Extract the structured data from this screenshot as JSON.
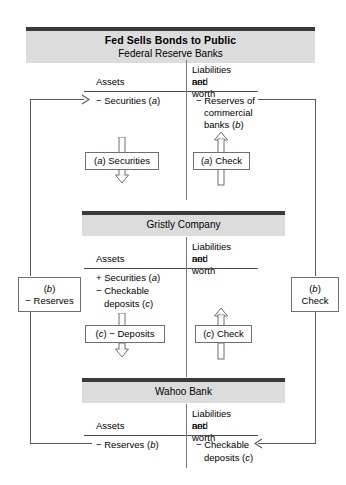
{
  "figure": {
    "title": "Fed Sells Bonds to Public",
    "subtitle": "Federal Reserve Banks"
  },
  "accounts": [
    {
      "name": "fed",
      "header_title": "Fed Sells Bonds to Public",
      "header_subtitle": "Federal Reserve Banks",
      "col_assets": "Assets",
      "col_liab_line1": "Liabilities and",
      "col_liab_line2": "net worth",
      "asset_entries": [
        "− Securities (a)"
      ],
      "liability_entries": [
        "− Reserves of",
        "commercial",
        "banks (b)"
      ]
    },
    {
      "name": "gristly",
      "header_title": "Gristly Company",
      "col_assets": "Assets",
      "col_liab_line1": "Liabilities and",
      "col_liab_line2": "net worth",
      "asset_entries": [
        "+ Securities (a)",
        "− Checkable",
        "deposits (c)"
      ],
      "liability_entries": []
    },
    {
      "name": "wahoo",
      "header_title": "Wahoo Bank",
      "col_assets": "Assets",
      "col_liab_line1": "Liabilities and",
      "col_liab_line2": "net worth",
      "asset_entries": [
        "− Reserves (b)"
      ],
      "liability_entries": [
        "− Checkable",
        "deposits (c)"
      ]
    }
  ],
  "flow_boxes": {
    "securities_a": "(a) Securities",
    "check_a": "(a) Check",
    "deposits_c": "(c) − Deposits",
    "check_c": "(c) Check"
  },
  "side_boxes": {
    "left_label_top": "(b)",
    "left_label_bottom": "− Reserves",
    "right_label_top": "(b)",
    "right_label_bottom": "Check"
  },
  "colors": {
    "header_band": "#dcdcdc",
    "header_rule": "#3a3a3a",
    "line": "#5a5a5a",
    "text": "#000000",
    "page": "#ffffff"
  }
}
